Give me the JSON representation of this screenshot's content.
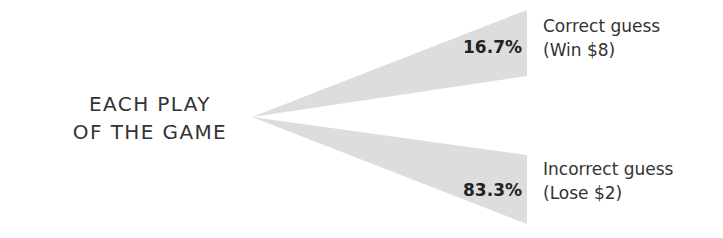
{
  "diagram": {
    "type": "probability-tree",
    "root": {
      "line1": "EACH PLAY",
      "line2": "OF THE GAME"
    },
    "branches": [
      {
        "probability": "16.7%",
        "outcome": "Correct guess",
        "payoff": "(Win $8)"
      },
      {
        "probability": "83.3%",
        "outcome": "Incorrect guess",
        "payoff": "(Lose $2)"
      }
    ],
    "colors": {
      "wedge_fill": "#dddddd",
      "text": "#333333",
      "percent_text": "#222222"
    }
  }
}
